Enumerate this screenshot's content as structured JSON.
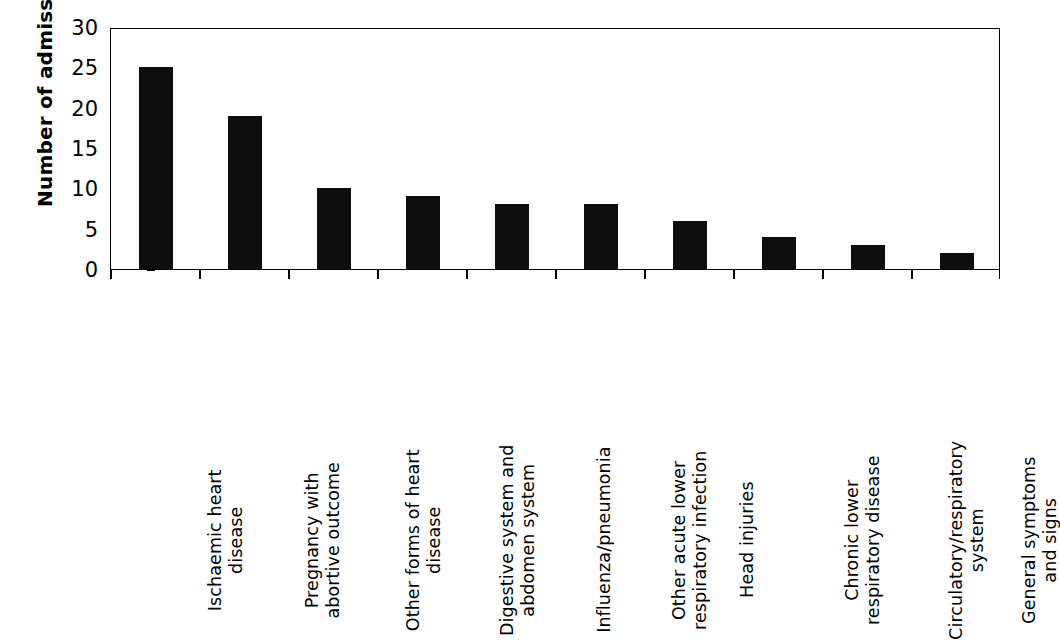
{
  "chart_data": {
    "type": "bar",
    "title": "",
    "xlabel": "",
    "ylabel": "Number of admissions",
    "ylim": [
      0,
      30
    ],
    "ytick_step": 5,
    "yticks": [
      0,
      5,
      10,
      15,
      20,
      25,
      30
    ],
    "ytick_labels": [
      "0",
      "5",
      "10",
      "15",
      "20",
      "25",
      "30"
    ],
    "grid": false,
    "legend": false,
    "bar_color": "#0d0d0d",
    "axis_color": "#000000",
    "background": "#ffffff",
    "categories": [
      "Ischaemic heart disease",
      "Pregnancy with abortive outcome",
      "Other forms of heart disease",
      "Digestive system and abdomen system",
      "Influenza/pneumonia",
      "Other acute lower respiratory infection",
      "Head injuries",
      "Chronic lower respiratory disease",
      "Circulatory/respiratory system",
      "General symptoms and signs"
    ],
    "category_lines": [
      [
        "Ischaemic heart",
        "disease"
      ],
      [
        "Pregnancy with",
        "abortive outcome"
      ],
      [
        "Other forms of heart",
        "disease"
      ],
      [
        "Digestive system and",
        "abdomen system"
      ],
      [
        "Influenza/pneumonia"
      ],
      [
        "Other acute lower",
        "respiratory infection"
      ],
      [
        "Head injuries"
      ],
      [
        "Chronic lower",
        "respiratory disease"
      ],
      [
        "Circulatory/respiratory",
        "system"
      ],
      [
        "General symptoms",
        "and signs"
      ]
    ],
    "values": [
      25,
      19,
      10,
      9,
      8,
      8,
      6,
      4,
      3,
      2
    ]
  }
}
